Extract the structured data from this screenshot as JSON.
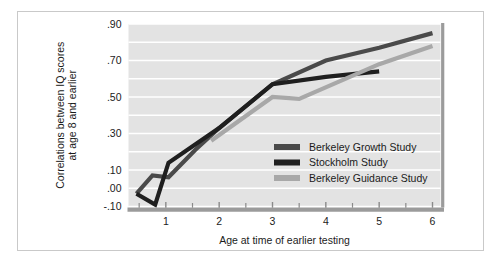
{
  "chart_data": {
    "type": "line",
    "title": "",
    "xlabel": "Age at time of earlier testing",
    "ylabel": "Correlations between IQ scores at age 8 and earlier",
    "ylabel_line1": "Correlations between IQ scores",
    "ylabel_line2": "at age 8 and earlier",
    "xlim": [
      0.3,
      6.15
    ],
    "ylim": [
      -0.1,
      0.9
    ],
    "xticks": [
      1,
      2,
      3,
      4,
      5,
      6
    ],
    "xtick_labels": [
      "1",
      "2",
      "3",
      "4",
      "5",
      "6"
    ],
    "xminor_ticks": [
      0.5,
      1.5,
      2.5,
      3.5,
      4.5,
      5.5
    ],
    "yticks": [
      -0.1,
      0.0,
      0.1,
      0.3,
      0.5,
      0.7,
      0.9
    ],
    "ytick_labels": [
      "-.10",
      ".00",
      ".10",
      ".30",
      ".50",
      ".70",
      ".90"
    ],
    "gridlines_y": [
      -0.1,
      0.0,
      0.1,
      0.2,
      0.3,
      0.4,
      0.5,
      0.6,
      0.7,
      0.8,
      0.9
    ],
    "grid": true,
    "grid_color": "#ffffff",
    "plot_background": "#e3e3e3",
    "legend_position": "inside-lower-right",
    "series": [
      {
        "name": "Berkeley Growth Study",
        "color": "#4a4a4a",
        "x": [
          0.45,
          0.75,
          1.05,
          1.55,
          2.0,
          3.0,
          4.0,
          5.0,
          6.0
        ],
        "y": [
          -0.03,
          0.07,
          0.06,
          0.21,
          0.33,
          0.57,
          0.7,
          0.77,
          0.85
        ]
      },
      {
        "name": "Stockholm Study",
        "color": "#1f1f1f",
        "x": [
          0.45,
          0.8,
          1.05,
          2.0,
          3.0,
          4.0,
          5.0
        ],
        "y": [
          -0.03,
          -0.09,
          0.14,
          0.33,
          0.57,
          0.61,
          0.64
        ]
      },
      {
        "name": "Berkeley Guidance Study",
        "color": "#a8a8a8",
        "x": [
          1.85,
          3.0,
          3.5,
          5.0,
          6.0
        ],
        "y": [
          0.26,
          0.5,
          0.49,
          0.68,
          0.78
        ]
      }
    ]
  },
  "legend": {
    "items": [
      {
        "label": "Berkeley Growth Study",
        "color": "#4a4a4a"
      },
      {
        "label": "Stockholm Study",
        "color": "#1f1f1f"
      },
      {
        "label": "Berkeley Guidance Study",
        "color": "#a8a8a8"
      }
    ]
  },
  "axes": {
    "x_axis_color": "#9b9b9b",
    "y_axis_color": "#9b9b9b",
    "tick_color": "#8a8a8a"
  },
  "frame": {
    "border_color": "#c9c9c9",
    "background": "#ffffff"
  }
}
